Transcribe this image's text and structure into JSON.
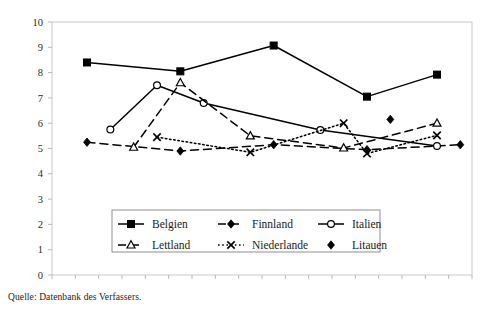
{
  "source_note": "Quelle: Datenbank des Verfassers.",
  "axes": {
    "y_ticks": [
      "0",
      "1",
      "2",
      "3",
      "4",
      "5",
      "6",
      "7",
      "8",
      "9",
      "10"
    ],
    "x_ticks": [
      "90",
      "91",
      "92",
      "93",
      "94",
      "95",
      "96",
      "97",
      "98",
      "99",
      "00",
      "01",
      "02",
      "03",
      "04",
      "05",
      "06",
      "07"
    ]
  },
  "legend": {
    "entries": [
      {
        "label": "Belgien",
        "marker": "filled-square-icon",
        "line": "solid"
      },
      {
        "label": "Finnland",
        "marker": "filled-diamond-icon",
        "line": "dashed"
      },
      {
        "label": "Italien",
        "marker": "open-circle-icon",
        "line": "solid"
      },
      {
        "label": "Lettland",
        "marker": "open-triangle-icon",
        "line": "dashed"
      },
      {
        "label": "Niederlande",
        "marker": "cross-x-icon",
        "line": "dotted"
      },
      {
        "label": "Litauen",
        "marker": "filled-diamond-icon",
        "line": "none"
      }
    ]
  },
  "chart_data": {
    "type": "line",
    "title": "",
    "xlabel": "",
    "ylabel": "",
    "xlim": [
      1990,
      2007
    ],
    "ylim": [
      0,
      10
    ],
    "ytick_step": 1,
    "grid": false,
    "legend_position": "inside-bottom-center",
    "x_tick_labels": [
      "90",
      "91",
      "92",
      "93",
      "94",
      "95",
      "96",
      "97",
      "98",
      "99",
      "00",
      "01",
      "02",
      "03",
      "04",
      "05",
      "06",
      "07"
    ],
    "x_tick_years": [
      1990,
      1991,
      1992,
      1993,
      1994,
      1995,
      1996,
      1997,
      1998,
      1999,
      2000,
      2001,
      2002,
      2003,
      2004,
      2005,
      2006,
      2007
    ],
    "series": [
      {
        "name": "Belgien",
        "marker": "filled-square",
        "line_style": "solid",
        "color": "#000000",
        "points": [
          {
            "x": 1991,
            "y": 8.4
          },
          {
            "x": 1995,
            "y": 8.05
          },
          {
            "x": 1999,
            "y": 9.07
          },
          {
            "x": 2003,
            "y": 7.05
          },
          {
            "x": 2006,
            "y": 7.92
          }
        ]
      },
      {
        "name": "Finnland",
        "marker": "filled-diamond",
        "line_style": "dashed",
        "color": "#000000",
        "points": [
          {
            "x": 1991,
            "y": 5.25
          },
          {
            "x": 1995,
            "y": 4.9
          },
          {
            "x": 1999,
            "y": 5.15
          },
          {
            "x": 2003,
            "y": 4.95
          },
          {
            "x": 2007,
            "y": 5.15
          }
        ]
      },
      {
        "name": "Italien",
        "marker": "open-circle",
        "line_style": "solid",
        "color": "#000000",
        "points": [
          {
            "x": 1992,
            "y": 5.75
          },
          {
            "x": 1994,
            "y": 7.5
          },
          {
            "x": 1996,
            "y": 6.8
          },
          {
            "x": 2001,
            "y": 5.73
          },
          {
            "x": 2006,
            "y": 5.1
          }
        ]
      },
      {
        "name": "Lettland",
        "marker": "open-triangle",
        "line_style": "dashed",
        "color": "#000000",
        "points": [
          {
            "x": 1993,
            "y": 5.05
          },
          {
            "x": 1995,
            "y": 7.6
          },
          {
            "x": 1998,
            "y": 5.5
          },
          {
            "x": 2002,
            "y": 5.02
          },
          {
            "x": 2006,
            "y": 6.0
          }
        ]
      },
      {
        "name": "Niederlande",
        "marker": "cross-x",
        "line_style": "dotted",
        "color": "#000000",
        "points": [
          {
            "x": 1994,
            "y": 5.45
          },
          {
            "x": 1998,
            "y": 4.85
          },
          {
            "x": 2002,
            "y": 6.0
          },
          {
            "x": 2003,
            "y": 4.8
          },
          {
            "x": 2006,
            "y": 5.52
          }
        ]
      },
      {
        "name": "Litauen",
        "marker": "filled-diamond",
        "line_style": "none",
        "color": "#000000",
        "points": [
          {
            "x": 2004,
            "y": 6.15
          }
        ]
      }
    ]
  }
}
